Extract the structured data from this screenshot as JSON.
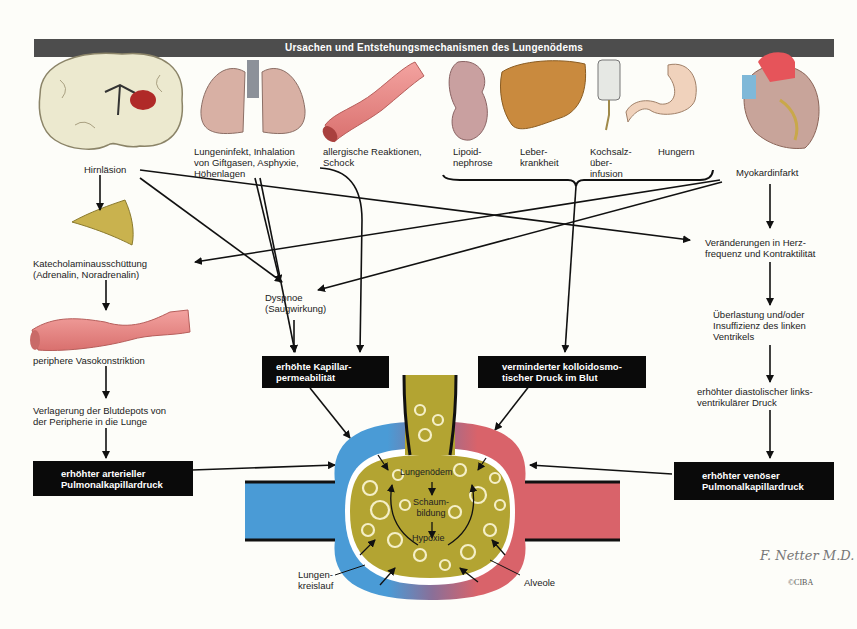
{
  "title": "Ursachen und Entstehungsmechanismen des Lungenödems",
  "causes": {
    "hirnlaesion": "Hirnläsion",
    "lungeninfekt": "Lungeninfekt, Inhalation\nvon Giftgasen, Asphyxie,\nHöhenlagen",
    "allergisch": "allergische Reaktionen,\nSchock",
    "lipoid": "Lipoid-\nnephrose",
    "leber": "Leber-\nkrankheit",
    "kochsalz": "Kochsalz-\nüber-\ninfusion",
    "hungern": "Hungern",
    "myokard": "Myokardinfarkt"
  },
  "left_chain": {
    "katecholamin": "Katecholaminausschüttung\n(Adrenalin, Noradrenalin)",
    "vasokonstriktion": "periphere Vasokonstriktion",
    "verlagerung": "Verlagerung der Blutdepots von\nder Peripherie in die Lunge",
    "box": "erhöhter arterieller\nPulmonalkapillardruck"
  },
  "middle": {
    "dyspnoe": "Dyspnoe\n(Saugwirkung)",
    "box_permeabilitaet": "erhöhte Kapillar-\npermeabilität",
    "box_kolloid": "verminderter kolloidosmo-\ntischer Druck im Blut"
  },
  "right_chain": {
    "herzfrequenz": "Veränderungen in Herz-\nfrequenz und Kontraktilität",
    "ueberlastung": "Überlastung und/oder\nInsuffizienz des linken\nVentrikels",
    "diastolisch": "erhöhter diastolischer links-\nventrikulärer Druck",
    "box": "erhöhter venöser\nPulmonalkapillardruck"
  },
  "alveolus": {
    "lungenoedem": "Lungenödem",
    "schaumbildung": "Schaum-\nbildung",
    "hypoxie": "Hypoxie",
    "lungenkreislauf": "Lungen-\nkreislauf",
    "alveole": "Alveole"
  },
  "signature": {
    "artist": "F. Netter M.D.",
    "copyright": "©CIBA"
  },
  "colors": {
    "title_bar": "#4d4d4d",
    "box": "#0a0a0a",
    "arterial_blue": "#4a9bd6",
    "venous_red": "#d9636a",
    "edema_fluid": "#b3a432",
    "background": "#fdfdf9"
  }
}
